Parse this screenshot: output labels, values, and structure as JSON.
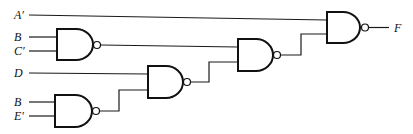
{
  "diagram": {
    "type": "logic-circuit",
    "gate_type": "NAND",
    "inputs": {
      "a_prime": "A′",
      "b1": "B",
      "c_prime": "C′",
      "d": "D",
      "b2": "B",
      "e_prime": "E′"
    },
    "output": "F",
    "gates": [
      {
        "id": "g1",
        "type": "NAND",
        "inputs": [
          "B",
          "C′"
        ]
      },
      {
        "id": "g4",
        "type": "NAND",
        "inputs": [
          "B",
          "E′"
        ]
      },
      {
        "id": "g2",
        "type": "NAND",
        "inputs": [
          "D",
          "g4"
        ]
      },
      {
        "id": "g3",
        "type": "NAND",
        "inputs": [
          "g1",
          "g2"
        ]
      },
      {
        "id": "g5",
        "type": "NAND",
        "inputs": [
          "A′",
          "g3"
        ],
        "output": "F"
      }
    ]
  }
}
